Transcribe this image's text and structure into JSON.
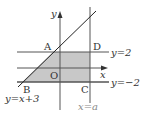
{
  "diagram": {
    "points": {
      "A": "A",
      "B": "B",
      "C": "C",
      "D": "D",
      "O": "O"
    },
    "axes": {
      "x_label": "x",
      "y_label": "y"
    },
    "lines": {
      "upper_horizontal": "y=2",
      "lower_horizontal": "y=−2",
      "diagonal": "y=x+3",
      "vertical": "x=a"
    },
    "colors": {
      "shade": "#c8c8c8",
      "line": "#333333",
      "vertical_label": "#888888"
    }
  }
}
